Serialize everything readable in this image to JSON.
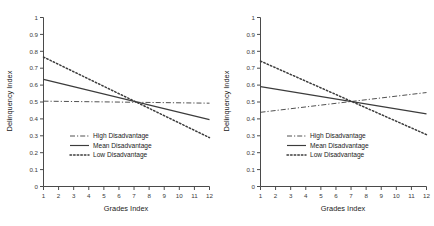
{
  "figure": {
    "panels": [
      {
        "id": "left-panel",
        "name": "left-chart"
      },
      {
        "id": "right-panel",
        "name": "right-chart"
      }
    ]
  },
  "axes": {
    "xlabel": "Grades Index",
    "ylabel": "Delinquency Index",
    "xticks": [
      "1",
      "2",
      "3",
      "4",
      "5",
      "6",
      "7",
      "8",
      "9",
      "10",
      "11",
      "12"
    ],
    "yticks": [
      "0",
      "0.1",
      "0.2",
      "0.3",
      "0.4",
      "0.5",
      "0.6",
      "0.7",
      "0.8",
      "0.9",
      "1"
    ]
  },
  "legend": {
    "high": "High Disadvantage",
    "mean": "Mean Disadvantage",
    "low": "Low Disadvantage"
  },
  "chart_data": [
    {
      "type": "line",
      "title": "",
      "panel": "left",
      "xlabel": "Grades Index",
      "ylabel": "Delinquency Index",
      "xlim": [
        1,
        12
      ],
      "ylim": [
        0,
        1
      ],
      "grid": false,
      "legend_position": "center-left",
      "x": [
        1,
        12
      ],
      "series": [
        {
          "name": "High Disadvantage",
          "style": "dashdot",
          "values": [
            0.505,
            0.493
          ]
        },
        {
          "name": "Mean Disadvantage",
          "style": "solid",
          "values": [
            0.634,
            0.396
          ]
        },
        {
          "name": "Low Disadvantage",
          "style": "dotted",
          "values": [
            0.766,
            0.289
          ]
        }
      ]
    },
    {
      "type": "line",
      "title": "",
      "panel": "right",
      "xlabel": "Grades Index",
      "ylabel": "Delinquency Index",
      "xlim": [
        1,
        12
      ],
      "ylim": [
        0,
        1
      ],
      "grid": false,
      "legend_position": "center-left",
      "x": [
        1,
        12
      ],
      "series": [
        {
          "name": "High Disadvantage",
          "style": "dashdot",
          "values": [
            0.439,
            0.556
          ]
        },
        {
          "name": "Mean Disadvantage",
          "style": "solid",
          "values": [
            0.591,
            0.43
          ]
        },
        {
          "name": "Low Disadvantage",
          "style": "dotted",
          "values": [
            0.742,
            0.307
          ]
        }
      ]
    }
  ],
  "colors": {
    "axis": "#4a4a4a",
    "line": "#3c3c3c",
    "text": "#222222",
    "background": "#ffffff"
  }
}
